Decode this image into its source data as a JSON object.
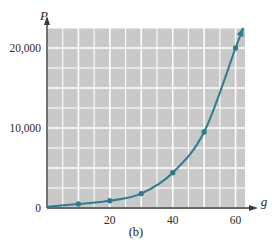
{
  "figure": {
    "caption": "(b)",
    "background_color": "#ffffff",
    "plot_background_color": "#c9c9c9",
    "grid_color": "#ffffff",
    "axis_color": "#3a3a3a",
    "curve_color": "#2d7d8f"
  },
  "chart_data": {
    "type": "line",
    "title": "",
    "subtitle": "",
    "xlabel": "g",
    "ylabel": "P",
    "xlim": [
      0,
      63
    ],
    "ylim": [
      0,
      22500
    ],
    "grid": true,
    "legend": null,
    "x_ticks": [
      20,
      40,
      60
    ],
    "x_tick_labels": [
      "20",
      "40",
      "60"
    ],
    "y_ticks": [
      0,
      10000,
      20000
    ],
    "y_tick_labels": [
      "0",
      "10,000",
      "20,000"
    ],
    "x_minor_step": 5,
    "y_minor_step": 2500,
    "markers": true,
    "arrow_at_curve_end": true,
    "x": [
      0,
      10,
      20,
      30,
      40,
      50,
      60
    ],
    "values": [
      150,
      500,
      900,
      1800,
      4400,
      9500,
      20000
    ],
    "series": [
      {
        "name": "P",
        "x": [
          0,
          10,
          20,
          30,
          40,
          50,
          60
        ],
        "values": [
          150,
          500,
          900,
          1800,
          4400,
          9500,
          20000
        ]
      }
    ],
    "annotations": [
      "(b)"
    ]
  }
}
